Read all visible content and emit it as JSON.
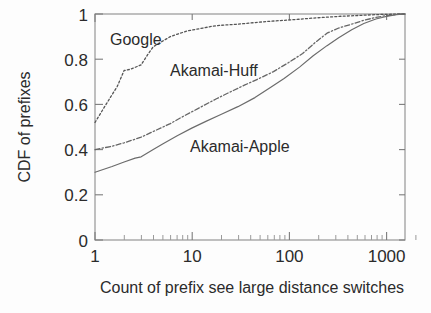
{
  "chart_data": {
    "type": "line",
    "title": "",
    "subtitle": "",
    "xlabel": "Count of prefix see large distance switches",
    "ylabel": "CDF of prefixes",
    "xscale": "log",
    "yscale": "linear",
    "xlim": [
      1,
      1600
    ],
    "ylim": [
      0,
      1
    ],
    "xticks": [
      1,
      10,
      100,
      1000
    ],
    "xtick_labels": [
      "1",
      "10",
      "100",
      "1000"
    ],
    "yticks": [
      0,
      0.2,
      0.4,
      0.6,
      0.8,
      1
    ],
    "ytick_labels": [
      "0",
      "0.2",
      "0.4",
      "0.6",
      "0.8",
      "1"
    ],
    "grid": false,
    "legend_position": "inline-annotations",
    "series": [
      {
        "name": "Google",
        "style": "dotted",
        "color": "#555555",
        "label_text": "Google",
        "x": [
          1,
          1.3,
          1.7,
          2,
          2.3,
          3,
          3.5,
          4,
          5,
          6,
          7,
          9,
          12,
          16,
          20,
          30,
          45,
          60,
          90,
          130,
          180,
          250,
          350,
          500,
          700,
          900,
          1200,
          1600
        ],
        "y": [
          0.52,
          0.6,
          0.68,
          0.75,
          0.755,
          0.775,
          0.82,
          0.855,
          0.88,
          0.9,
          0.91,
          0.925,
          0.935,
          0.945,
          0.95,
          0.955,
          0.962,
          0.967,
          0.972,
          0.977,
          0.982,
          0.986,
          0.99,
          0.993,
          0.996,
          0.998,
          0.999,
          1.0
        ]
      },
      {
        "name": "Akamai-Huff",
        "style": "dash-dot",
        "color": "#666666",
        "label_text": "Akamai-Huff",
        "x": [
          1,
          1.5,
          2,
          3,
          4,
          6,
          8,
          12,
          18,
          25,
          35,
          50,
          70,
          100,
          140,
          190,
          250,
          330,
          450,
          600,
          800,
          1000,
          1300,
          1600
        ],
        "y": [
          0.4,
          0.415,
          0.43,
          0.455,
          0.48,
          0.515,
          0.545,
          0.585,
          0.625,
          0.655,
          0.685,
          0.715,
          0.745,
          0.785,
          0.825,
          0.875,
          0.915,
          0.938,
          0.955,
          0.972,
          0.985,
          0.992,
          0.998,
          1.0
        ]
      },
      {
        "name": "Akamai-Apple",
        "style": "solid",
        "color": "#6b6b6b",
        "label_text": "Akamai-Apple",
        "x": [
          1,
          1.5,
          2,
          2.6,
          3,
          4,
          5,
          7,
          10,
          14,
          20,
          30,
          45,
          65,
          90,
          130,
          180,
          250,
          330,
          450,
          600,
          800,
          1000,
          1300,
          1600
        ],
        "y": [
          0.3,
          0.325,
          0.345,
          0.362,
          0.368,
          0.4,
          0.425,
          0.46,
          0.495,
          0.525,
          0.555,
          0.59,
          0.63,
          0.675,
          0.715,
          0.765,
          0.815,
          0.86,
          0.895,
          0.93,
          0.958,
          0.978,
          0.988,
          0.997,
          1.0
        ]
      }
    ]
  },
  "axes": {
    "x_title": "Count of prefix see large distance switches",
    "y_title": "CDF of prefixes",
    "x_tick_labels": [
      "1",
      "10",
      "100",
      "1000"
    ],
    "y_tick_labels": [
      "1",
      "0.8",
      "0.6",
      "0.4",
      "0.2",
      "0"
    ]
  },
  "annotations": {
    "google": "Google",
    "akamai_huff": "Akamai-Huff",
    "akamai_apple": "Akamai-Apple"
  },
  "colors": {
    "background": "#fdfdfd",
    "axis": "#8d8d8d",
    "text": "#2b2b2b",
    "google": "#555555",
    "akamai_huff": "#666666",
    "akamai_apple": "#6b6b6b"
  }
}
